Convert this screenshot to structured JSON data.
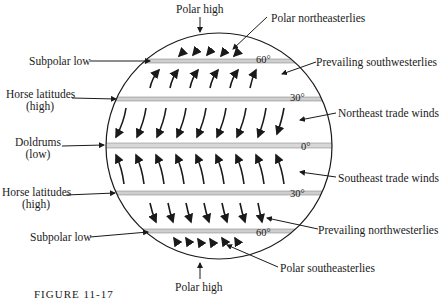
{
  "diagram": {
    "pressure_belts": [
      {
        "id": "polar-high-north",
        "label": "Polar high"
      },
      {
        "id": "subpolar-low-north",
        "label": "Subpolar low"
      },
      {
        "id": "horse-lat-north",
        "label": "Horse latitudes",
        "sub": "(high)"
      },
      {
        "id": "doldrums",
        "label": "Doldrums",
        "sub": "(low)"
      },
      {
        "id": "horse-lat-south",
        "label": "Horse latitudes",
        "sub": "(high)"
      },
      {
        "id": "subpolar-low-south",
        "label": "Subpolar low"
      },
      {
        "id": "polar-high-south",
        "label": "Polar high"
      }
    ],
    "winds": [
      {
        "id": "polar-ne",
        "label": "Polar northeasterlies"
      },
      {
        "id": "prev-sw",
        "label": "Prevailing southwesterlies"
      },
      {
        "id": "ne-trade",
        "label": "Northeast trade winds"
      },
      {
        "id": "se-trade",
        "label": "Southeast trade winds"
      },
      {
        "id": "prev-nw",
        "label": "Prevailing northwesterlies"
      },
      {
        "id": "polar-se",
        "label": "Polar southeasterlies"
      }
    ],
    "latitudes": [
      "60°",
      "30°",
      "0°",
      "30°",
      "60°"
    ],
    "caption": "FIGURE 11-17"
  }
}
